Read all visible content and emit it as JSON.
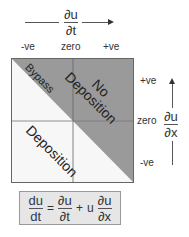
{
  "top_axis": {
    "label_numerator": "∂u",
    "label_denominator": "∂t",
    "ticks": [
      "-ve",
      "zero",
      "+ve"
    ]
  },
  "right_axis": {
    "label_numerator": "∂u",
    "label_denominator": "∂x",
    "ticks": [
      "+ve",
      "zero",
      "-ve"
    ]
  },
  "regions": {
    "bypass": "Bypass",
    "no_deposition_line1": "No",
    "no_deposition_line2": "Deposition",
    "deposition": "Deposition"
  },
  "formula": {
    "lhs_num": "du",
    "lhs_den": "dt",
    "equals": "=",
    "term1_num": "∂u",
    "term1_den": "∂t",
    "plus": "+",
    "u": "u",
    "term2_num": "∂u",
    "term2_den": "∂x"
  },
  "colors": {
    "dark_region": "#9a9a9a",
    "light_region": "#f7f7f7",
    "formula_bg": "#e6e6e6"
  }
}
